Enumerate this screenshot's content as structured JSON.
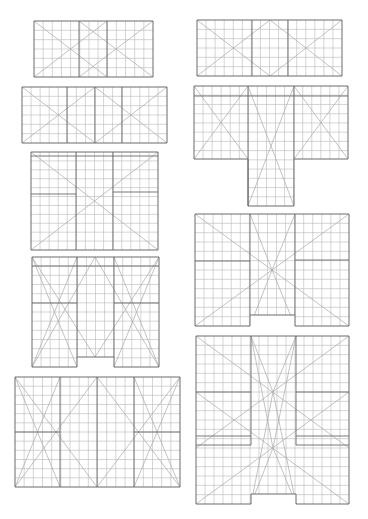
{
  "figure": {
    "colors": {
      "grid": "#b9b9b9",
      "outline": "#6a6a6a",
      "diagonal": "#a9a9a9",
      "background": "#ffffff"
    },
    "panels": [
      {
        "id": "L1",
        "x": 34,
        "y": 21,
        "w": 119,
        "h": 56,
        "cols": 13,
        "rows": 6,
        "shape": [
          [
            0,
            0
          ],
          [
            119,
            0
          ],
          [
            119,
            56
          ],
          [
            0,
            56
          ]
        ],
        "dividers": [
          [
            45,
            0,
            45,
            56
          ],
          [
            73,
            0,
            73,
            56
          ]
        ],
        "diagonals": [
          [
            0,
            0,
            73,
            56
          ],
          [
            0,
            56,
            73,
            0
          ],
          [
            45,
            0,
            119,
            56
          ],
          [
            45,
            56,
            119,
            0
          ]
        ]
      },
      {
        "id": "L2",
        "x": 22,
        "y": 87,
        "w": 145,
        "h": 56,
        "cols": 16,
        "rows": 6,
        "shape": [
          [
            0,
            0
          ],
          [
            145,
            0
          ],
          [
            145,
            56
          ],
          [
            0,
            56
          ]
        ],
        "dividers": [
          [
            45,
            0,
            45,
            56
          ],
          [
            73,
            0,
            73,
            56
          ],
          [
            100,
            0,
            100,
            56
          ]
        ],
        "diagonals": [
          [
            0,
            0,
            73,
            56
          ],
          [
            0,
            56,
            73,
            0
          ],
          [
            73,
            0,
            145,
            56
          ],
          [
            73,
            56,
            145,
            0
          ]
        ]
      },
      {
        "id": "L3",
        "x": 31,
        "y": 152,
        "w": 127,
        "h": 98,
        "cols": 14,
        "rows": 11,
        "shape": [
          [
            0,
            0
          ],
          [
            127,
            0
          ],
          [
            127,
            98
          ],
          [
            0,
            98
          ]
        ],
        "dividers": [
          [
            45,
            0,
            45,
            98
          ],
          [
            82,
            0,
            82,
            98
          ],
          [
            0,
            4,
            127,
            4
          ],
          [
            0,
            42,
            45,
            42
          ],
          [
            82,
            40,
            127,
            40
          ]
        ],
        "diagonals": [
          [
            0,
            0,
            127,
            98
          ],
          [
            0,
            98,
            127,
            0
          ]
        ]
      },
      {
        "id": "L4",
        "x": 32,
        "y": 257,
        "w": 127,
        "h": 110,
        "cols": 14,
        "rows": 12,
        "shape": [
          [
            0,
            0
          ],
          [
            127,
            0
          ],
          [
            127,
            110
          ],
          [
            82,
            110
          ],
          [
            82,
            100
          ],
          [
            45,
            100
          ],
          [
            45,
            110
          ],
          [
            0,
            110
          ]
        ],
        "dividers": [
          [
            45,
            0,
            45,
            100
          ],
          [
            82,
            0,
            82,
            100
          ],
          [
            0,
            9,
            127,
            9
          ],
          [
            0,
            46,
            45,
            46
          ],
          [
            82,
            46,
            127,
            46
          ]
        ],
        "diagonals": [
          [
            0,
            0,
            45,
            110
          ],
          [
            0,
            110,
            45,
            0
          ],
          [
            82,
            0,
            127,
            110
          ],
          [
            82,
            110,
            127,
            0
          ],
          [
            0,
            0,
            63,
            100
          ],
          [
            127,
            0,
            63,
            100
          ],
          [
            0,
            110,
            63,
            0
          ],
          [
            127,
            110,
            63,
            0
          ]
        ]
      },
      {
        "id": "L5",
        "x": 15,
        "y": 377,
        "w": 165,
        "h": 110,
        "cols": 18,
        "rows": 12,
        "shape": [
          [
            0,
            0
          ],
          [
            165,
            0
          ],
          [
            165,
            110
          ],
          [
            0,
            110
          ]
        ],
        "dividers": [
          [
            45,
            0,
            45,
            110
          ],
          [
            82,
            0,
            82,
            110
          ],
          [
            119,
            0,
            119,
            110
          ],
          [
            0,
            55,
            45,
            55
          ],
          [
            119,
            55,
            165,
            55
          ]
        ],
        "diagonals": [
          [
            0,
            0,
            45,
            110
          ],
          [
            0,
            110,
            45,
            0
          ],
          [
            119,
            0,
            165,
            110
          ],
          [
            119,
            110,
            165,
            0
          ],
          [
            0,
            110,
            82,
            0
          ],
          [
            82,
            0,
            165,
            110
          ],
          [
            0,
            0,
            82,
            110
          ],
          [
            82,
            110,
            165,
            0
          ]
        ]
      },
      {
        "id": "R1",
        "x": 197,
        "y": 20,
        "w": 145,
        "h": 56,
        "cols": 16,
        "rows": 6,
        "shape": [
          [
            0,
            0
          ],
          [
            145,
            0
          ],
          [
            145,
            56
          ],
          [
            0,
            56
          ]
        ],
        "dividers": [
          [
            55,
            0,
            55,
            56
          ],
          [
            91,
            0,
            91,
            56
          ]
        ],
        "diagonals": [
          [
            0,
            0,
            73,
            56
          ],
          [
            0,
            56,
            73,
            0
          ],
          [
            73,
            0,
            145,
            56
          ],
          [
            73,
            56,
            145,
            0
          ]
        ]
      },
      {
        "id": "R2",
        "x": 194,
        "y": 86,
        "w": 154,
        "h": 120,
        "cols": 17,
        "rows": 13,
        "shape": [
          [
            0,
            0
          ],
          [
            154,
            0
          ],
          [
            154,
            73
          ],
          [
            100,
            73
          ],
          [
            100,
            120
          ],
          [
            54,
            120
          ],
          [
            54,
            73
          ],
          [
            0,
            73
          ]
        ],
        "dividers": [
          [
            54,
            0,
            54,
            120
          ],
          [
            100,
            0,
            100,
            73
          ],
          [
            0,
            10,
            154,
            10
          ]
        ],
        "diagonals": [
          [
            0,
            0,
            54,
            73
          ],
          [
            0,
            73,
            54,
            0
          ],
          [
            100,
            0,
            154,
            73
          ],
          [
            100,
            73,
            154,
            0
          ],
          [
            54,
            0,
            100,
            120
          ],
          [
            54,
            120,
            100,
            0
          ]
        ]
      },
      {
        "id": "R3",
        "x": 195,
        "y": 214,
        "w": 154,
        "h": 112,
        "cols": 17,
        "rows": 12,
        "shape": [
          [
            0,
            0
          ],
          [
            154,
            0
          ],
          [
            154,
            112
          ],
          [
            100,
            112
          ],
          [
            100,
            101
          ],
          [
            55,
            101
          ],
          [
            55,
            112
          ],
          [
            0,
            112
          ]
        ],
        "dividers": [
          [
            55,
            0,
            55,
            101
          ],
          [
            100,
            0,
            100,
            101
          ],
          [
            0,
            47,
            55,
            47
          ],
          [
            100,
            46,
            154,
            46
          ]
        ],
        "diagonals": [
          [
            0,
            0,
            154,
            112
          ],
          [
            0,
            112,
            154,
            0
          ],
          [
            55,
            0,
            77,
            56
          ],
          [
            100,
            0,
            77,
            56
          ],
          [
            77,
            56,
            55,
            112
          ],
          [
            77,
            56,
            100,
            112
          ]
        ]
      },
      {
        "id": "R4",
        "x": 196,
        "y": 336,
        "w": 153,
        "h": 168,
        "cols": 17,
        "rows": 18,
        "shape": [
          [
            0,
            0
          ],
          [
            153,
            0
          ],
          [
            153,
            168
          ],
          [
            100,
            168
          ],
          [
            100,
            158
          ],
          [
            55,
            158
          ],
          [
            55,
            168
          ],
          [
            0,
            168
          ]
        ],
        "dividers": [
          [
            55,
            0,
            55,
            109
          ],
          [
            100,
            0,
            100,
            109
          ],
          [
            0,
            56,
            55,
            56
          ],
          [
            100,
            56,
            153,
            56
          ],
          [
            0,
            100,
            55,
            100
          ],
          [
            100,
            100,
            153,
            100
          ],
          [
            0,
            109,
            55,
            109
          ],
          [
            100,
            109,
            153,
            109
          ]
        ],
        "diagonals": [
          [
            0,
            0,
            153,
            112
          ],
          [
            0,
            112,
            153,
            0
          ],
          [
            0,
            56,
            153,
            168
          ],
          [
            0,
            168,
            153,
            56
          ],
          [
            55,
            0,
            77,
            56
          ],
          [
            100,
            0,
            77,
            56
          ],
          [
            55,
            0,
            77,
            112
          ],
          [
            100,
            0,
            77,
            112
          ],
          [
            77,
            56,
            55,
            168
          ],
          [
            77,
            56,
            100,
            168
          ],
          [
            77,
            112,
            55,
            168
          ],
          [
            77,
            112,
            100,
            168
          ]
        ]
      }
    ]
  }
}
